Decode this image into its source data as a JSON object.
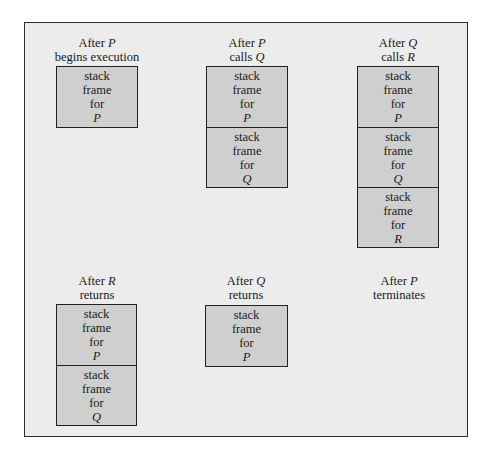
{
  "diagram": {
    "title": "",
    "colors": {
      "panel": "#ececec",
      "frame": "#cfcfcf",
      "border": "#222222"
    },
    "states": [
      {
        "caption_line1": "After",
        "caption_var1": "P",
        "caption_line2": "begins execution",
        "caption_var2": "",
        "frames": [
          {
            "l1": "stack",
            "l2": "frame",
            "l3": "for",
            "name": "P"
          }
        ]
      },
      {
        "caption_line1": "After",
        "caption_var1": "P",
        "caption_line2": "calls",
        "caption_var2": "Q",
        "frames": [
          {
            "l1": "stack",
            "l2": "frame",
            "l3": "for",
            "name": "P"
          },
          {
            "l1": "stack",
            "l2": "frame",
            "l3": "for",
            "name": "Q"
          }
        ]
      },
      {
        "caption_line1": "After",
        "caption_var1": "Q",
        "caption_line2": "calls",
        "caption_var2": "R",
        "frames": [
          {
            "l1": "stack",
            "l2": "frame",
            "l3": "for",
            "name": "P"
          },
          {
            "l1": "stack",
            "l2": "frame",
            "l3": "for",
            "name": "Q"
          },
          {
            "l1": "stack",
            "l2": "frame",
            "l3": "for",
            "name": "R"
          }
        ]
      },
      {
        "caption_line1": "After",
        "caption_var1": "R",
        "caption_line2": "returns",
        "caption_var2": "",
        "frames": [
          {
            "l1": "stack",
            "l2": "frame",
            "l3": "for",
            "name": "P"
          },
          {
            "l1": "stack",
            "l2": "frame",
            "l3": "for",
            "name": "Q"
          }
        ]
      },
      {
        "caption_line1": "After",
        "caption_var1": "Q",
        "caption_line2": "returns",
        "caption_var2": "",
        "frames": [
          {
            "l1": "stack",
            "l2": "frame",
            "l3": "for",
            "name": "P"
          }
        ]
      },
      {
        "caption_line1": "After",
        "caption_var1": "P",
        "caption_line2": "terminates",
        "caption_var2": "",
        "frames": []
      }
    ]
  }
}
